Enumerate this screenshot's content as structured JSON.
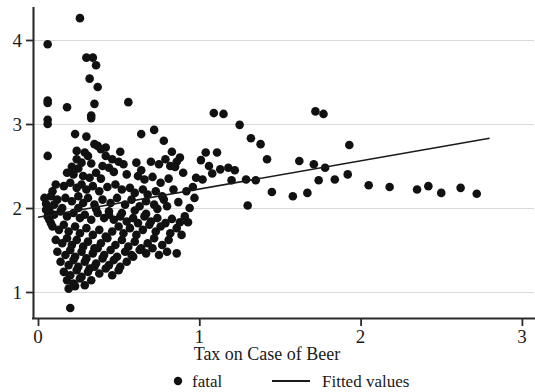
{
  "chart_data": {
    "type": "scatter",
    "title": "",
    "xlabel": "Tax on Case of Beer",
    "ylabel": "",
    "xlim": [
      -0.03,
      3.1
    ],
    "ylim": [
      0.72,
      4.38
    ],
    "xticks": [
      0,
      1,
      2,
      3
    ],
    "xtick_labels": [
      "0",
      "1",
      "2",
      "3"
    ],
    "yticks": [
      1,
      2,
      3,
      4
    ],
    "ytick_labels": [
      "1",
      "2",
      "3",
      "4"
    ],
    "grid": "horizontal",
    "legend_position": "below",
    "legend": [
      {
        "label": "fatal",
        "marker": "circle",
        "color": "#111111"
      },
      {
        "label": "Fitted values",
        "marker": "line",
        "color": "#1a1a1a"
      }
    ],
    "series": [
      {
        "name": "fatal",
        "type": "scatter",
        "marker": "circle",
        "color": "#111111",
        "points": [
          [
            0.26,
            4.26
          ],
          [
            0.06,
            3.95
          ],
          [
            0.3,
            3.79
          ],
          [
            0.34,
            3.79
          ],
          [
            0.36,
            3.7
          ],
          [
            0.32,
            3.54
          ],
          [
            0.37,
            3.44
          ],
          [
            0.06,
            3.28
          ],
          [
            0.06,
            3.25
          ],
          [
            0.18,
            3.2
          ],
          [
            0.35,
            3.24
          ],
          [
            0.06,
            3.05
          ],
          [
            0.06,
            3.0
          ],
          [
            0.33,
            3.1
          ],
          [
            0.33,
            3.07
          ],
          [
            0.56,
            3.26
          ],
          [
            1.09,
            3.13
          ],
          [
            1.15,
            3.12
          ],
          [
            1.25,
            2.99
          ],
          [
            1.32,
            2.83
          ],
          [
            1.38,
            2.76
          ],
          [
            0.06,
            2.62
          ],
          [
            0.23,
            2.88
          ],
          [
            0.3,
            2.85
          ],
          [
            0.35,
            2.76
          ],
          [
            0.37,
            2.74
          ],
          [
            0.42,
            2.72
          ],
          [
            0.24,
            2.68
          ],
          [
            0.29,
            2.66
          ],
          [
            0.39,
            2.7
          ],
          [
            0.64,
            2.88
          ],
          [
            0.72,
            2.93
          ],
          [
            0.78,
            2.8
          ],
          [
            0.83,
            2.67
          ],
          [
            1.04,
            2.66
          ],
          [
            1.11,
            2.66
          ],
          [
            0.51,
            2.67
          ],
          [
            0.24,
            2.58
          ],
          [
            0.27,
            2.54
          ],
          [
            0.31,
            2.62
          ],
          [
            0.42,
            2.62
          ],
          [
            0.46,
            2.58
          ],
          [
            0.21,
            2.49
          ],
          [
            0.25,
            2.47
          ],
          [
            0.33,
            2.53
          ],
          [
            0.4,
            2.5
          ],
          [
            0.44,
            2.48
          ],
          [
            0.5,
            2.55
          ],
          [
            0.53,
            2.52
          ],
          [
            0.61,
            2.54
          ],
          [
            0.64,
            2.45
          ],
          [
            0.7,
            2.55
          ],
          [
            0.75,
            2.52
          ],
          [
            0.79,
            2.58
          ],
          [
            0.82,
            2.5
          ],
          [
            0.85,
            2.49
          ],
          [
            0.86,
            2.55
          ],
          [
            0.88,
            2.6
          ],
          [
            1.42,
            2.58
          ],
          [
            1.62,
            2.56
          ],
          [
            1.71,
            2.52
          ],
          [
            1.78,
            2.48
          ],
          [
            0.18,
            2.42
          ],
          [
            0.22,
            2.4
          ],
          [
            0.28,
            2.38
          ],
          [
            0.32,
            2.36
          ],
          [
            0.36,
            2.42
          ],
          [
            0.39,
            2.35
          ],
          [
            0.47,
            2.43
          ],
          [
            0.55,
            2.4
          ],
          [
            0.62,
            2.38
          ],
          [
            0.66,
            2.34
          ],
          [
            0.71,
            2.37
          ],
          [
            0.76,
            2.3
          ],
          [
            0.81,
            2.35
          ],
          [
            0.9,
            2.42
          ],
          [
            0.98,
            2.36
          ],
          [
            1.02,
            2.34
          ],
          [
            1.2,
            2.33
          ],
          [
            1.29,
            2.34
          ],
          [
            1.35,
            2.33
          ],
          [
            1.92,
            2.4
          ],
          [
            2.05,
            2.27
          ],
          [
            0.11,
            2.28
          ],
          [
            0.16,
            2.26
          ],
          [
            0.2,
            2.3
          ],
          [
            0.24,
            2.24
          ],
          [
            0.27,
            2.28
          ],
          [
            0.3,
            2.22
          ],
          [
            0.34,
            2.26
          ],
          [
            0.38,
            2.2
          ],
          [
            0.43,
            2.25
          ],
          [
            0.48,
            2.28
          ],
          [
            0.52,
            2.22
          ],
          [
            0.57,
            2.24
          ],
          [
            0.6,
            2.18
          ],
          [
            0.65,
            2.22
          ],
          [
            0.68,
            2.16
          ],
          [
            0.73,
            2.2
          ],
          [
            0.77,
            2.14
          ],
          [
            0.84,
            2.22
          ],
          [
            0.92,
            2.2
          ],
          [
            1.45,
            2.19
          ],
          [
            1.58,
            2.14
          ],
          [
            1.67,
            2.18
          ],
          [
            2.18,
            2.25
          ],
          [
            2.35,
            2.22
          ],
          [
            2.5,
            2.18
          ],
          [
            0.08,
            2.14
          ],
          [
            0.12,
            2.1
          ],
          [
            0.17,
            2.12
          ],
          [
            0.21,
            2.08
          ],
          [
            0.25,
            2.14
          ],
          [
            0.28,
            2.06
          ],
          [
            0.31,
            2.12
          ],
          [
            0.35,
            2.04
          ],
          [
            0.4,
            2.1
          ],
          [
            0.45,
            2.06
          ],
          [
            0.49,
            2.12
          ],
          [
            0.54,
            2.04
          ],
          [
            0.58,
            2.1
          ],
          [
            0.63,
            2.02
          ],
          [
            0.67,
            2.08
          ],
          [
            0.72,
            2.04
          ],
          [
            0.78,
            2.1
          ],
          [
            0.8,
            2.02
          ],
          [
            0.87,
            2.07
          ],
          [
            0.94,
            2.0
          ],
          [
            1.3,
            2.03
          ],
          [
            0.07,
            1.98
          ],
          [
            0.1,
            1.92
          ],
          [
            0.14,
            1.96
          ],
          [
            0.18,
            1.9
          ],
          [
            0.22,
            1.94
          ],
          [
            0.26,
            1.88
          ],
          [
            0.29,
            1.92
          ],
          [
            0.33,
            1.86
          ],
          [
            0.37,
            1.94
          ],
          [
            0.41,
            1.88
          ],
          [
            0.44,
            1.92
          ],
          [
            0.47,
            1.86
          ],
          [
            0.51,
            1.9
          ],
          [
            0.55,
            1.84
          ],
          [
            0.59,
            1.88
          ],
          [
            0.62,
            1.82
          ],
          [
            0.66,
            1.9
          ],
          [
            0.7,
            1.84
          ],
          [
            0.74,
            1.88
          ],
          [
            0.79,
            1.82
          ],
          [
            0.83,
            1.87
          ],
          [
            0.88,
            1.83
          ],
          [
            0.91,
            1.9
          ],
          [
            0.09,
            1.78
          ],
          [
            0.13,
            1.74
          ],
          [
            0.16,
            1.8
          ],
          [
            0.19,
            1.72
          ],
          [
            0.23,
            1.78
          ],
          [
            0.26,
            1.7
          ],
          [
            0.3,
            1.76
          ],
          [
            0.34,
            1.68
          ],
          [
            0.38,
            1.74
          ],
          [
            0.42,
            1.66
          ],
          [
            0.46,
            1.72
          ],
          [
            0.5,
            1.78
          ],
          [
            0.53,
            1.7
          ],
          [
            0.57,
            1.76
          ],
          [
            0.61,
            1.68
          ],
          [
            0.65,
            1.74
          ],
          [
            0.69,
            1.8
          ],
          [
            0.73,
            1.72
          ],
          [
            0.76,
            1.78
          ],
          [
            0.82,
            1.7
          ],
          [
            0.86,
            1.76
          ],
          [
            0.89,
            1.68
          ],
          [
            0.11,
            1.62
          ],
          [
            0.15,
            1.58
          ],
          [
            0.18,
            1.64
          ],
          [
            0.21,
            1.56
          ],
          [
            0.24,
            1.62
          ],
          [
            0.28,
            1.54
          ],
          [
            0.31,
            1.6
          ],
          [
            0.35,
            1.52
          ],
          [
            0.39,
            1.58
          ],
          [
            0.43,
            1.64
          ],
          [
            0.48,
            1.56
          ],
          [
            0.52,
            1.62
          ],
          [
            0.56,
            1.54
          ],
          [
            0.6,
            1.6
          ],
          [
            0.64,
            1.52
          ],
          [
            0.68,
            1.58
          ],
          [
            0.72,
            1.64
          ],
          [
            0.77,
            1.56
          ],
          [
            0.81,
            1.62
          ],
          [
            0.12,
            1.48
          ],
          [
            0.17,
            1.44
          ],
          [
            0.2,
            1.5
          ],
          [
            0.23,
            1.42
          ],
          [
            0.27,
            1.48
          ],
          [
            0.3,
            1.4
          ],
          [
            0.34,
            1.46
          ],
          [
            0.37,
            1.52
          ],
          [
            0.41,
            1.44
          ],
          [
            0.45,
            1.5
          ],
          [
            0.49,
            1.42
          ],
          [
            0.54,
            1.48
          ],
          [
            0.58,
            1.44
          ],
          [
            0.63,
            1.5
          ],
          [
            0.67,
            1.46
          ],
          [
            0.71,
            1.52
          ],
          [
            0.75,
            1.44
          ],
          [
            0.8,
            1.48
          ],
          [
            0.14,
            1.36
          ],
          [
            0.19,
            1.32
          ],
          [
            0.22,
            1.38
          ],
          [
            0.25,
            1.3
          ],
          [
            0.29,
            1.36
          ],
          [
            0.32,
            1.28
          ],
          [
            0.36,
            1.34
          ],
          [
            0.4,
            1.4
          ],
          [
            0.44,
            1.32
          ],
          [
            0.47,
            1.38
          ],
          [
            0.51,
            1.3
          ],
          [
            0.55,
            1.36
          ],
          [
            0.59,
            1.42
          ],
          [
            0.16,
            1.24
          ],
          [
            0.2,
            1.2
          ],
          [
            0.24,
            1.26
          ],
          [
            0.27,
            1.18
          ],
          [
            0.31,
            1.24
          ],
          [
            0.35,
            1.3
          ],
          [
            0.38,
            1.22
          ],
          [
            0.42,
            1.28
          ],
          [
            0.46,
            1.2
          ],
          [
            0.5,
            1.26
          ],
          [
            0.18,
            1.14
          ],
          [
            0.22,
            1.1
          ],
          [
            0.26,
            1.16
          ],
          [
            0.29,
            1.08
          ],
          [
            0.33,
            1.14
          ],
          [
            0.19,
            1.04
          ],
          [
            0.23,
            1.07
          ],
          [
            0.2,
            0.81
          ],
          [
            0.86,
            1.46
          ],
          [
            0.93,
            1.83
          ],
          [
            0.05,
            2.05
          ],
          [
            0.05,
            1.98
          ],
          [
            0.06,
            1.9
          ],
          [
            0.07,
            1.86
          ],
          [
            0.04,
            2.12
          ],
          [
            0.09,
            2.2
          ],
          [
            0.1,
            2.04
          ],
          [
            0.08,
            1.82
          ],
          [
            1.77,
            3.12
          ],
          [
            1.72,
            3.15
          ],
          [
            1.93,
            2.75
          ],
          [
            2.62,
            2.24
          ],
          [
            2.72,
            2.17
          ],
          [
            2.42,
            2.26
          ],
          [
            1.84,
            2.34
          ],
          [
            1.74,
            2.33
          ],
          [
            0.97,
            2.12
          ],
          [
            1.06,
            2.5
          ],
          [
            1.13,
            2.46
          ],
          [
            1.18,
            2.48
          ],
          [
            1.22,
            2.45
          ],
          [
            1.08,
            2.41
          ],
          [
            1.01,
            2.57
          ],
          [
            0.96,
            2.25
          ],
          [
            0.44,
            1.96
          ],
          [
            0.52,
            1.94
          ],
          [
            0.6,
            1.97
          ],
          [
            0.67,
            1.93
          ],
          [
            0.74,
            1.99
          ],
          [
            0.15,
            2.0
          ],
          [
            0.25,
            2.0
          ],
          [
            0.36,
            1.99
          ]
        ]
      },
      {
        "name": "Fitted values",
        "type": "line",
        "color": "#1a1a1a",
        "endpoints": [
          [
            0.0,
            1.89
          ],
          [
            2.8,
            2.83
          ]
        ],
        "slope": 0.336,
        "intercept": 1.89
      }
    ]
  },
  "axes": {
    "x_title": "Tax on Case of Beer"
  },
  "legend": {
    "item1_label": "fatal",
    "item2_label": "Fitted values"
  }
}
